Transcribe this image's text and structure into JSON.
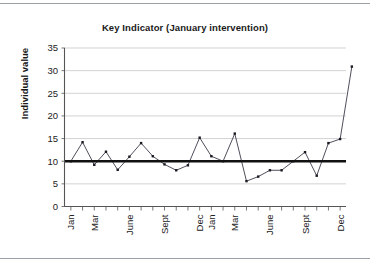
{
  "chart_data": {
    "type": "line",
    "title": "Key Indicator (January intervention)",
    "xlabel": "",
    "ylabel": "Individual value",
    "ylim": [
      0,
      35
    ],
    "ytick_step": 5,
    "ytick_labels": [
      "0",
      "5",
      "10",
      "15",
      "20",
      "25",
      "30",
      "35"
    ],
    "ytick_values": [
      0,
      5,
      10,
      15,
      20,
      25,
      30,
      35
    ],
    "grid": "horizontal",
    "legend": "none",
    "x": [
      "Jan",
      "Feb",
      "Mar",
      "Apr",
      "May",
      "June",
      "July",
      "Aug",
      "Sept",
      "Oct",
      "Nov",
      "Dec",
      "Jan",
      "Feb",
      "Mar",
      "Apr",
      "May",
      "June",
      "July",
      "Aug",
      "Sept",
      "Oct",
      "Nov",
      "Dec"
    ],
    "xtick_labels_shown": [
      "Jan",
      "Mar",
      "June",
      "Sept",
      "Dec",
      "Jan",
      "Mar",
      "June",
      "Sept",
      "Dec"
    ],
    "xtick_label_indices": [
      0,
      2,
      5,
      8,
      11,
      12,
      14,
      17,
      20,
      23
    ],
    "xtick_count": 24,
    "series": [
      {
        "name": "Individual value",
        "values": [
          10,
          14.2,
          9.2,
          12.1,
          8.1,
          11.0,
          14.0,
          11.1,
          9.3,
          8.0,
          9.1,
          15.2,
          11.1,
          10.0,
          16.1,
          5.6,
          6.6,
          8.0,
          8.0,
          10.0,
          12.0,
          6.8,
          14.0,
          14.9
        ]
      }
    ],
    "annotations": [
      {
        "name": "center-line",
        "type": "horizontal-line",
        "value": 10,
        "color": "#111111",
        "label": ""
      },
      {
        "name": "final-point",
        "type": "data-point",
        "value": 30.9,
        "label": ""
      }
    ],
    "colors": {
      "series": "#3b3b4a",
      "marker": "#1a1a22",
      "center_line": "#111111",
      "grid": "#bfbfbf",
      "axis": "#555555",
      "text": "#1a1a1a",
      "background": "#ffffff"
    }
  }
}
